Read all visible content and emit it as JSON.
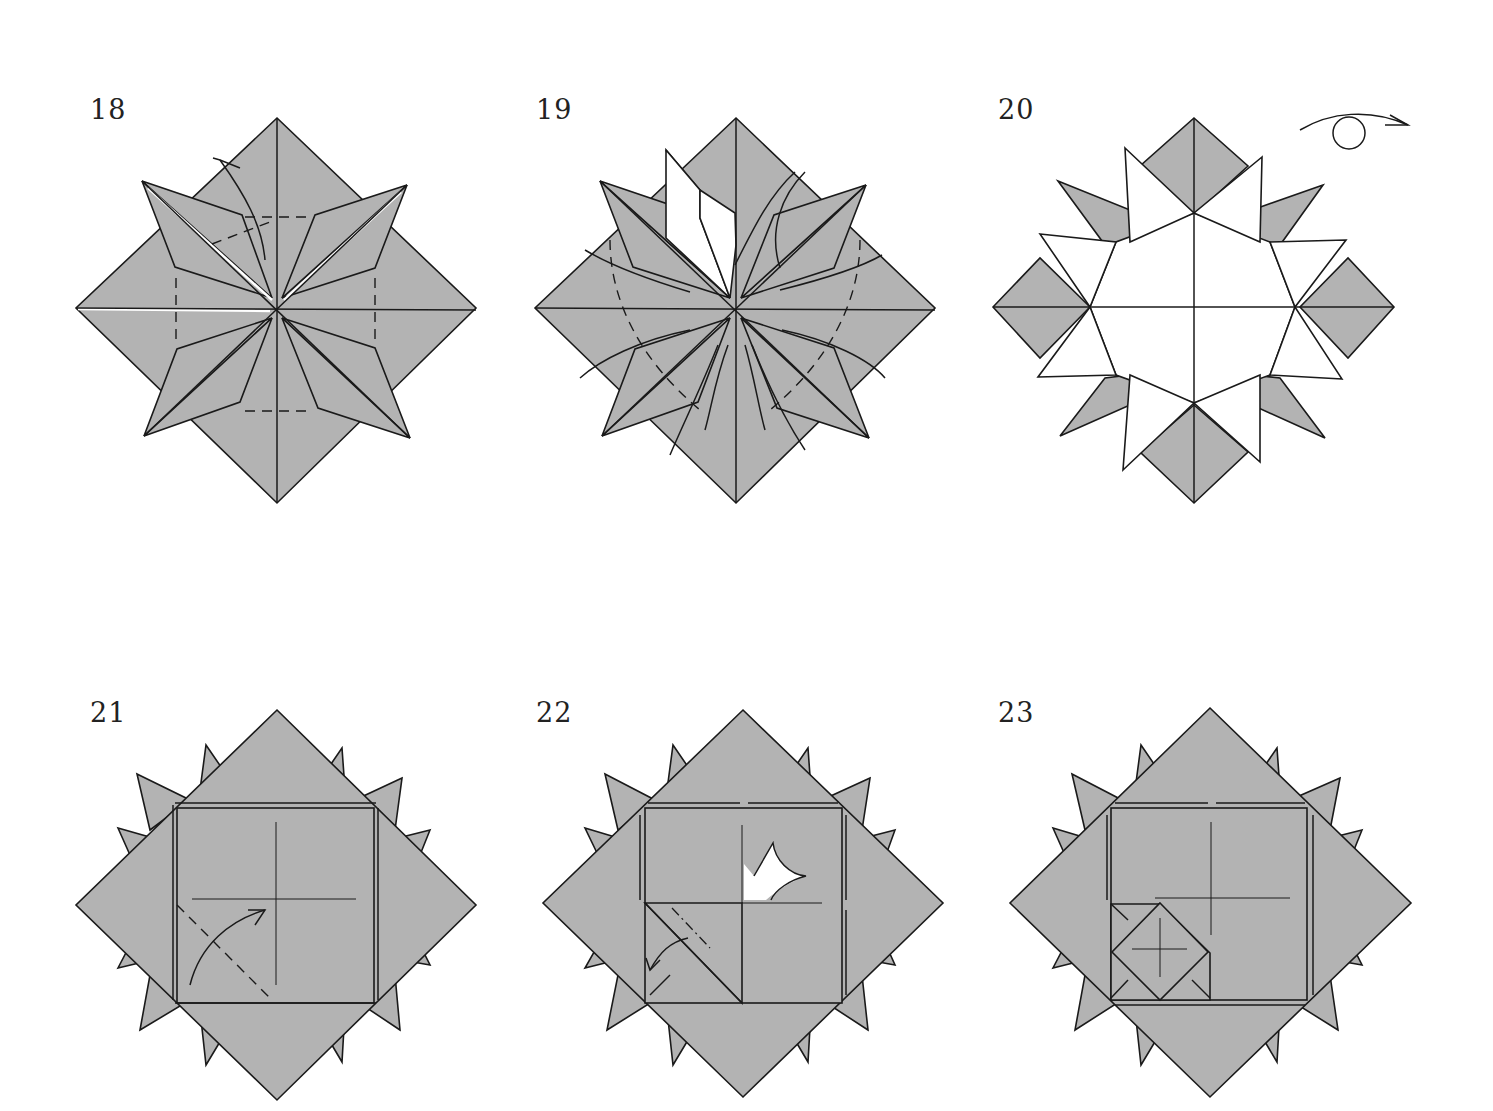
{
  "page": {
    "type": "origami-instruction-diagrams",
    "colors": {
      "paper_color": "#b3b3b3",
      "paper_white_side": "#ffffff",
      "line_color": "#1a1a1a",
      "background": "#ffffff"
    }
  },
  "steps": [
    {
      "number": "18",
      "description": "Eight-pointed star base with valley-fold dashed guide lines and a curved arrow lifting a flap"
    },
    {
      "number": "19",
      "description": "Same base with one flap folded open showing white side; curved arrows on all flaps indicating repeat"
    },
    {
      "number": "20",
      "description": "Star with white triangular points around an octagonal white center; turn-over symbol top right"
    },
    {
      "number": "21",
      "description": "Square-in-diamond model with dashed valley fold across bottom-left corner and curved arrow"
    },
    {
      "number": "22",
      "description": "Corner folded in; mountain fold dot-dash line with curved arrow; push-in (squash) arrow at upper right quadrant"
    },
    {
      "number": "23",
      "description": "Small diamond flap folded into bottom-left quadrant with crease marks"
    }
  ],
  "symbols": {
    "turn_over": "turn-over-icon",
    "fold_arrow": "curved-arrow-icon",
    "push_arrow": "push-in-arrow-icon"
  }
}
